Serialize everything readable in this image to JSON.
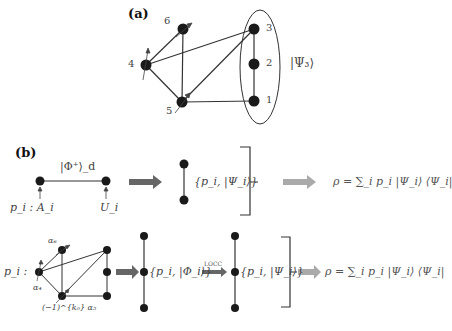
{
  "panel_a": {
    "label": "(a)",
    "node_labels": {
      "n1": "1",
      "n2": "2",
      "n3": "3",
      "n4": "4",
      "n5": "5",
      "n6": "6"
    },
    "psi_label": "|Ψ₃⟩"
  },
  "panel_b": {
    "label": "(b)",
    "row1": {
      "bell_label": "|Φ⁺⟩_d",
      "left_caption": "p_i : A_i",
      "right_caption": "U_i",
      "ensemble_label": "{p_i, |Ψ_i⟩}",
      "rho_formula": "ρ = ∑_i p_i |Ψ_i⟩ ⟨Ψ_i|"
    },
    "row2": {
      "p_label": "p_i :",
      "alpha6": "α₆",
      "alpha4": "α₄",
      "alpha5": "(−1)^{k₀} α₅",
      "ensemble_phi": "{p_i, |Φ_i⟩}",
      "locc_label": "LOCC",
      "ensemble_psi": "{p_i, |Ψ_i⟩}",
      "rho_formula": "ρ = ∑_i p_i |Ψ_i⟩ ⟨Ψ_i|"
    }
  },
  "colors": {
    "node": "#1a1a1a",
    "edge": "#333333",
    "dark_arrow": "#666666",
    "light_arrow": "#aaaaaa"
  }
}
